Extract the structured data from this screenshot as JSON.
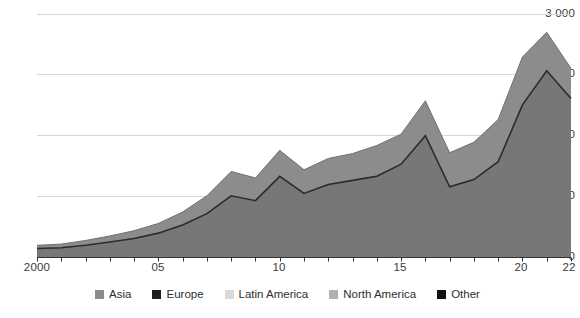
{
  "chart_data": {
    "type": "area",
    "stacked": true,
    "title": "",
    "subtitle": "",
    "xlabel": "",
    "ylabel": "",
    "x": [
      2000,
      2001,
      2002,
      2003,
      2004,
      2005,
      2006,
      2007,
      2008,
      2009,
      2010,
      2011,
      2012,
      2013,
      2014,
      2015,
      2016,
      2017,
      2018,
      2019,
      2020,
      2021,
      2022
    ],
    "xtick_labels": [
      "2000",
      "05",
      "10",
      "15",
      "20",
      "22"
    ],
    "xtick_values": [
      2000,
      2005,
      2010,
      2015,
      2020,
      2022
    ],
    "ytick_labels": [
      "0",
      "750",
      "1 500",
      "2 250",
      "3 000"
    ],
    "ytick_values": [
      0,
      750,
      1500,
      2250,
      3000
    ],
    "ylim": [
      0,
      3000
    ],
    "xlim": [
      2000,
      2022
    ],
    "grid": "horizontal",
    "legend_position": "bottom",
    "series": [
      {
        "name": "Asia",
        "color": "#8c8c8c",
        "values": [
          55,
          60,
          75,
          95,
          115,
          145,
          195,
          260,
          360,
          335,
          420,
          330,
          350,
          395,
          430,
          430,
          420,
          420,
          490,
          530,
          660,
          475,
          370
        ]
      },
      {
        "name": "Europe",
        "color": "#1f1f1f",
        "values": [
          12,
          13,
          15,
          18,
          20,
          24,
          30,
          38,
          48,
          44,
          55,
          44,
          46,
          50,
          54,
          54,
          52,
          52,
          60,
          64,
          80,
          58,
          45
        ]
      },
      {
        "name": "Latin America",
        "color": "#d9d9d9",
        "values": [
          4,
          4,
          5,
          6,
          7,
          8,
          10,
          13,
          16,
          15,
          18,
          15,
          15,
          17,
          18,
          18,
          17,
          17,
          20,
          21,
          26,
          19,
          15
        ]
      },
      {
        "name": "North America",
        "color": "#b0b0b0",
        "values": [
          18,
          20,
          24,
          30,
          36,
          45,
          60,
          80,
          105,
          98,
          125,
          100,
          105,
          118,
          128,
          128,
          124,
          124,
          145,
          158,
          196,
          142,
          110
        ]
      },
      {
        "name": "Other",
        "color": "#111111",
        "values": [
          6,
          7,
          8,
          10,
          12,
          15,
          20,
          26,
          35,
          33,
          42,
          33,
          35,
          40,
          43,
          43,
          42,
          42,
          49,
          53,
          66,
          48,
          37
        ]
      }
    ],
    "totals_upper_band": [
      95,
      104,
      127,
      159,
      190,
      237,
      315,
      417,
      564,
      525,
      660,
      522,
      551,
      620,
      673,
      673,
      655,
      655,
      764,
      826,
      1028,
      742,
      577
    ],
    "totals": [
      110,
      120,
      150,
      190,
      235,
      300,
      400,
      540,
      760,
      700,
      1000,
      790,
      900,
      950,
      1000,
      1150,
      1500,
      870,
      960,
      1180,
      1880,
      2300,
      1960
    ],
    "stacked_totals": [
      150,
      165,
      210,
      265,
      330,
      420,
      560,
      760,
      1060,
      980,
      1320,
      1080,
      1220,
      1280,
      1380,
      1520,
      1930,
      1290,
      1420,
      1700,
      2470,
      2775,
      2330
    ]
  },
  "legend": {
    "items": [
      {
        "label": "Asia",
        "color": "#8c8c8c"
      },
      {
        "label": "Europe",
        "color": "#1f1f1f"
      },
      {
        "label": "Latin America",
        "color": "#d9d9d9"
      },
      {
        "label": "North America",
        "color": "#b0b0b0"
      },
      {
        "label": "Other",
        "color": "#111111"
      }
    ]
  },
  "axis": {
    "y_labels": [
      "3 000",
      "2 250",
      "1 500",
      "750",
      "0"
    ],
    "x_labels": [
      "2000",
      "05",
      "10",
      "15",
      "20",
      "22"
    ]
  },
  "style": {
    "grid_color": "#d6d6d6",
    "axis_color": "#333333",
    "band_upper": "#8c8c8c",
    "band_lower": "#777777",
    "band_outline": "#2b2b2b",
    "background": "#ffffff"
  }
}
